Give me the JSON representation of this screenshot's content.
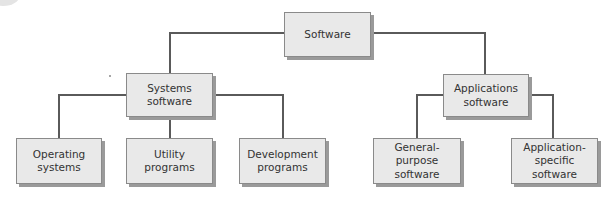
{
  "diagram": {
    "type": "hierarchy-tree",
    "root": {
      "label": "Software"
    },
    "level1": [
      {
        "label": "Systems\nsoftware"
      },
      {
        "label": "Applications\nsoftware"
      }
    ],
    "level2": [
      {
        "label": "Operating\nsystems",
        "parent": "Systems software"
      },
      {
        "label": "Utility\nprograms",
        "parent": "Systems software"
      },
      {
        "label": "Development\nprograms",
        "parent": "Systems software"
      },
      {
        "label": "General-\npurpose\nsoftware",
        "parent": "Applications software"
      },
      {
        "label": "Application-\nspecific\nsoftware",
        "parent": "Applications software"
      }
    ],
    "colors": {
      "box_fill": "#e9e9e9",
      "box_border": "#8a8a8a",
      "connector": "#5a5a5a",
      "text": "#333333"
    }
  }
}
